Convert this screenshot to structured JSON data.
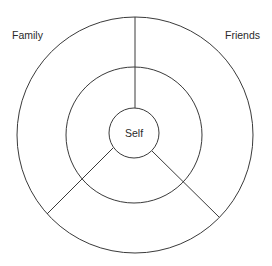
{
  "diagram": {
    "type": "concentric-circles",
    "labels": {
      "outer_left": "Family",
      "outer_right": "Friends",
      "center": "Self"
    },
    "rings": [
      {
        "name": "outer",
        "cx": 135,
        "cy": 135,
        "r": 118
      },
      {
        "name": "middle",
        "cx": 134,
        "cy": 135,
        "r": 68
      },
      {
        "name": "inner",
        "cx": 134,
        "cy": 133,
        "r": 25
      }
    ],
    "sectors": [
      "Family",
      "Friends",
      "bottom"
    ],
    "colors": {
      "stroke": "#3a3a3a",
      "text": "#2a2a2a",
      "background": "#ffffff"
    }
  }
}
